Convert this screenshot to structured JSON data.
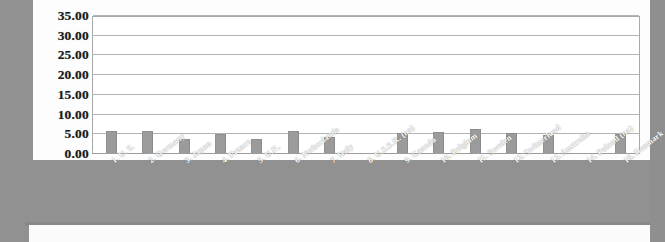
{
  "chart_data": {
    "type": "bar",
    "title": "",
    "xlabel": "",
    "ylabel": "",
    "ylim": [
      0,
      35
    ],
    "ytick_step": 5,
    "grid": true,
    "legend": "none",
    "bar_color": "#9b9b9b",
    "plot_background": "#ffffff",
    "page_background": "#919191",
    "label_color": "#ffffff",
    "ytick_labels": [
      "35.00",
      "30.00",
      "25.00",
      "20.00",
      "15.00",
      "10.00",
      "5.00",
      "0.00"
    ],
    "ytick_values": [
      35,
      30,
      25,
      20,
      15,
      10,
      5,
      0
    ],
    "categories": [
      "1. U. S.",
      "2. Germany",
      "3. Japan",
      "4. France",
      "5. U.K.",
      "6. Netherlands",
      "7. Italy",
      "8. U.S.S.R. (na)",
      "9. Canada",
      "10. Belgium",
      "11. Sweden",
      "12. Switzerland",
      "13. Australia",
      "14. Poland (na)",
      "16. Denmark"
    ],
    "values": [
      5.8,
      5.8,
      3.9,
      5.0,
      3.7,
      5.9,
      4.4,
      null,
      5.3,
      5.5,
      6.3,
      5.4,
      4.9,
      null,
      5.0
    ]
  }
}
